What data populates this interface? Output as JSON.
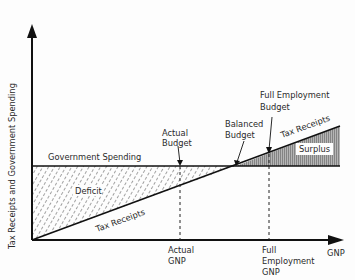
{
  "diagram": {
    "y_axis_label": "Tax Receipts and Government Spending",
    "x_axis_label": "GNP",
    "lines": {
      "government_spending": "Government Spending",
      "tax_receipts_lower": "Tax Receipts",
      "tax_receipts_upper": "Tax Receipts"
    },
    "regions": {
      "deficit": "Deficit",
      "surplus": "Surplus"
    },
    "callouts": {
      "actual_budget_line1": "Actual",
      "actual_budget_line2": "Budget",
      "balanced_budget_line1": "Balanced",
      "balanced_budget_line2": "Budget",
      "full_employment_budget_line1": "Full Employment",
      "full_employment_budget_line2": "Budget"
    },
    "x_ticks": {
      "actual_gnp_line1": "Actual",
      "actual_gnp_line2": "GNP",
      "full_gnp_line1": "Full",
      "full_gnp_line2": "Employment",
      "full_gnp_line3": "GNP"
    },
    "colors": {
      "ink": "#111111",
      "surplus_fill": "#9a9a9a",
      "background": "#fdfdfd"
    }
  }
}
